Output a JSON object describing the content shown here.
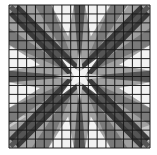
{
  "image": {
    "description": "Grayscale star quilt pattern with grid overlay",
    "width": 157,
    "height": 155,
    "frame": {
      "x": 9,
      "y": 5,
      "w": 141,
      "h": 143
    },
    "grid": {
      "rows": 16,
      "cols": 16,
      "line_color": "#1a1a1a",
      "line_width": 1
    },
    "background": "#9a9a9a",
    "colors": {
      "white": "#f2f2f2",
      "light": "#c8c8c8",
      "mid": "#a0a0a0",
      "midDark": "#7a7a7a",
      "dark": "#555555",
      "darker": "#3a3a3a"
    }
  }
}
